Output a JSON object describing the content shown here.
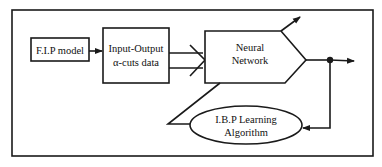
{
  "diagram": {
    "type": "block-flow",
    "nodes": [
      {
        "id": "fip",
        "label": "F.I.P model",
        "shape": "rectangle"
      },
      {
        "id": "io",
        "label_lines": [
          "Input-Output",
          "α-cuts data"
        ],
        "shape": "rectangle"
      },
      {
        "id": "nn",
        "label_lines": [
          "Neural",
          "Network"
        ],
        "shape": "pentagon"
      },
      {
        "id": "ibp",
        "label_lines": [
          "I.B.P Learning",
          "Algorithm"
        ],
        "shape": "ellipse"
      }
    ],
    "edges": [
      {
        "from": "fip",
        "to": "io",
        "style": "arrow"
      },
      {
        "from": "io",
        "to": "nn",
        "style": "double-line-arrow"
      },
      {
        "from": "nn",
        "to": "output",
        "style": "arrow",
        "note": "output with junction dot"
      },
      {
        "from": "junction",
        "to": "ibp",
        "style": "feedback-arrow"
      },
      {
        "from": "ibp",
        "to": "nn",
        "style": "diagonal-adjust-arrow"
      }
    ],
    "colors": {
      "stroke": "#1a1a1a",
      "background": "#ffffff"
    }
  },
  "labels": {
    "fip": "F.I.P model",
    "io_line1": "Input-Output",
    "io_line2": "α-cuts data",
    "nn_line1": "Neural",
    "nn_line2": "Network",
    "ibp_line1": "I.B.P Learning",
    "ibp_line2": "Algorithm"
  }
}
